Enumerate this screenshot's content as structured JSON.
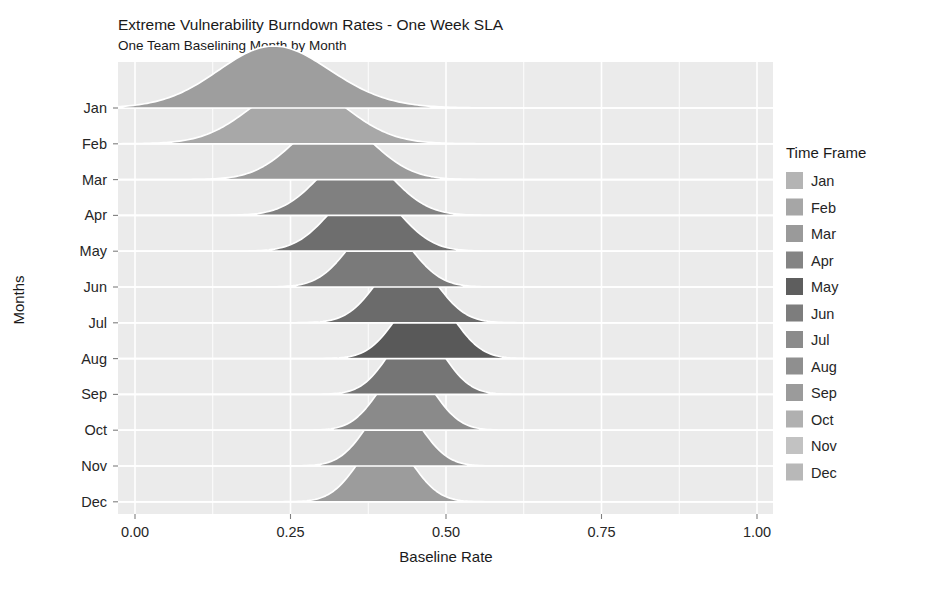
{
  "chart_data": {
    "type": "area",
    "title": "Extreme Vulnerability Burndown Rates - One Week SLA",
    "subtitle": "One Team Baselining Month by Month",
    "xlabel": "Baseline Rate",
    "ylabel": "Months",
    "legend_title": "Time Frame",
    "legend_position": "right",
    "grid": true,
    "xlim": [
      -0.05,
      1.08
    ],
    "xticks": [
      0.0,
      0.25,
      0.5,
      0.75,
      1.0
    ],
    "xtick_labels": [
      "0.00",
      "0.25",
      "0.50",
      "0.75",
      "1.00"
    ],
    "categories": [
      "Jan",
      "Feb",
      "Mar",
      "Apr",
      "May",
      "Jun",
      "Jul",
      "Aug",
      "Sep",
      "Oct",
      "Nov",
      "Dec"
    ],
    "panel_color": "#ebebeb",
    "grid_color": "#ffffff",
    "ridge_outline_color": "#ffffff",
    "series": [
      {
        "name": "Jan",
        "mean": 0.175,
        "sd": 0.105,
        "skew": 0.75,
        "height": 1.0,
        "color": "#9e9e9e"
      },
      {
        "name": "Feb",
        "mean": 0.235,
        "sd": 0.082,
        "skew": 0.45,
        "height": 0.95,
        "color": "#a8a8a8"
      },
      {
        "name": "Mar",
        "mean": 0.305,
        "sd": 0.066,
        "skew": 0.25,
        "height": 0.96,
        "color": "#9a9a9a"
      },
      {
        "name": "Apr",
        "mean": 0.345,
        "sd": 0.06,
        "skew": 0.18,
        "height": 1.0,
        "color": "#808080"
      },
      {
        "name": "May",
        "mean": 0.362,
        "sd": 0.056,
        "skew": 0.14,
        "height": 1.02,
        "color": "#6e6e6e"
      },
      {
        "name": "Jun",
        "mean": 0.388,
        "sd": 0.05,
        "skew": 0.12,
        "height": 1.04,
        "color": "#7a7a7a"
      },
      {
        "name": "Jul",
        "mean": 0.432,
        "sd": 0.048,
        "skew": 0.1,
        "height": 1.06,
        "color": "#6b6b6b"
      },
      {
        "name": "Aug",
        "mean": 0.462,
        "sd": 0.046,
        "skew": 0.1,
        "height": 1.08,
        "color": "#595959"
      },
      {
        "name": "Sep",
        "mean": 0.448,
        "sd": 0.044,
        "skew": 0.1,
        "height": 1.06,
        "color": "#757575"
      },
      {
        "name": "Oct",
        "mean": 0.432,
        "sd": 0.044,
        "skew": 0.1,
        "height": 1.04,
        "color": "#8a8a8a"
      },
      {
        "name": "Nov",
        "mean": 0.412,
        "sd": 0.044,
        "skew": 0.1,
        "height": 1.03,
        "color": "#909090"
      },
      {
        "name": "Dec",
        "mean": 0.398,
        "sd": 0.044,
        "skew": 0.1,
        "height": 1.02,
        "color": "#9c9c9c"
      }
    ],
    "legend_items": [
      {
        "label": "Jan",
        "color": "#b4b4b4"
      },
      {
        "label": "Feb",
        "color": "#a6a6a6"
      },
      {
        "label": "Mar",
        "color": "#9a9a9a"
      },
      {
        "label": "Apr",
        "color": "#848484"
      },
      {
        "label": "May",
        "color": "#5e5e5e"
      },
      {
        "label": "Jun",
        "color": "#7d7d7d"
      },
      {
        "label": "Jul",
        "color": "#8b8b8b"
      },
      {
        "label": "Aug",
        "color": "#8f8f8f"
      },
      {
        "label": "Sep",
        "color": "#9b9b9b"
      },
      {
        "label": "Oct",
        "color": "#b0b0b0"
      },
      {
        "label": "Nov",
        "color": "#c2c2c2"
      },
      {
        "label": "Dec",
        "color": "#b8b8b8"
      }
    ]
  },
  "layout": {
    "panel": {
      "x": 118,
      "y": 62,
      "width": 655,
      "height": 452
    },
    "x_zero_px": 135,
    "x_unit_px": 622,
    "baseline_top_px": 108,
    "baseline_step_px": 35.8,
    "ridge_amplitude_px": 62
  }
}
